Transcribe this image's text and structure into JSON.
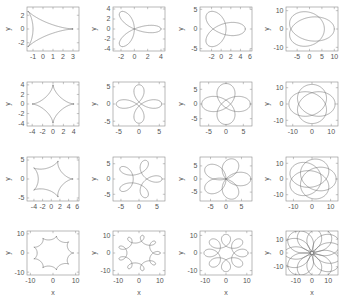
{
  "figure": {
    "type": "small-multiples",
    "rows": 4,
    "cols": 4,
    "background": "#ffffff",
    "curve_color": "#6b6b6b",
    "axis_color": "#8a8a8a",
    "text_color": "#555555"
  },
  "axis_titles": {
    "x": "x",
    "y": "y"
  },
  "chart_data": [
    {
      "id": "plot-r1c1",
      "type": "line",
      "title": "",
      "xlabel": "",
      "ylabel": "y",
      "curve": "hypotrochoid",
      "params": {
        "R": 3,
        "r": 1,
        "d": 1,
        "cusps": 3
      },
      "xlim": [
        -1.6,
        3.6
      ],
      "ylim": [
        -3.2,
        3.2
      ],
      "xticks": [
        -1,
        0,
        1,
        2,
        3
      ],
      "yticks": [
        -2,
        0,
        2
      ],
      "xticklabels": [
        "-1",
        "0",
        "1",
        "2",
        "3"
      ],
      "yticklabels": [
        "-2",
        "0",
        "2"
      ],
      "grid": false,
      "legend": "none"
    },
    {
      "id": "plot-r1c2",
      "type": "line",
      "xlabel": "",
      "ylabel": "y",
      "curve": "hypotrochoid",
      "params": {
        "R": 3,
        "r": 1,
        "d": 2,
        "cusps": 3
      },
      "xlim": [
        -3.2,
        4.6
      ],
      "ylim": [
        -4.4,
        4.4
      ],
      "xticks": [
        -2,
        0,
        2,
        4
      ],
      "yticks": [
        -4,
        -2,
        0,
        2,
        4
      ],
      "xticklabels": [
        "-2",
        "0",
        "2",
        "4"
      ],
      "yticklabels": [
        "-4",
        "-2",
        "0",
        "2",
        "4"
      ],
      "grid": false,
      "legend": "none"
    },
    {
      "id": "plot-r1c3",
      "type": "line",
      "xlabel": "",
      "ylabel": "y",
      "curve": "hypotrochoid",
      "params": {
        "R": 3,
        "r": 1,
        "d": 3,
        "cusps": 3
      },
      "xlim": [
        -4.4,
        6.4
      ],
      "ylim": [
        -5.6,
        5.6
      ],
      "xticks": [
        -2,
        0,
        2,
        4,
        6
      ],
      "yticks": [
        -5,
        0,
        5
      ],
      "xticklabels": [
        "-2",
        "0",
        "2",
        "4",
        "6"
      ],
      "yticklabels": [
        "-5",
        "0",
        "5"
      ],
      "grid": false,
      "legend": "none"
    },
    {
      "id": "plot-r1c4",
      "type": "line",
      "xlabel": "",
      "ylabel": "y",
      "curve": "hypotrochoid",
      "params": {
        "R": 3,
        "r": 1,
        "d": 8,
        "cusps": 3
      },
      "xlim": [
        -9.5,
        11.5
      ],
      "ylim": [
        -12,
        12
      ],
      "xticks": [
        -5,
        0,
        5,
        10
      ],
      "yticks": [
        -10,
        0,
        10
      ],
      "xticklabels": [
        "-5",
        "0",
        "5",
        "10"
      ],
      "yticklabels": [
        "-10",
        "0",
        "10"
      ],
      "grid": false,
      "legend": "none"
    },
    {
      "id": "plot-r2c1",
      "type": "line",
      "xlabel": "",
      "ylabel": "y",
      "curve": "hypotrochoid",
      "params": {
        "R": 4,
        "r": 1,
        "d": 1,
        "cusps": 4
      },
      "xlim": [
        -5.0,
        5.0
      ],
      "ylim": [
        -4.6,
        4.6
      ],
      "xticks": [
        -4,
        -2,
        0,
        2,
        4
      ],
      "yticks": [
        -4,
        -2,
        0,
        2,
        4
      ],
      "xticklabels": [
        "-4",
        "-2",
        "0",
        "2",
        "4"
      ],
      "yticklabels": [
        "-4",
        "-2",
        "0",
        "2",
        "4"
      ],
      "grid": false,
      "legend": "none"
    },
    {
      "id": "plot-r2c2",
      "type": "line",
      "xlabel": "",
      "ylabel": "y",
      "curve": "hypotrochoid",
      "params": {
        "R": 4,
        "r": 1,
        "d": 2.6,
        "cusps": 4
      },
      "xlim": [
        -6.4,
        6.4
      ],
      "ylim": [
        -6.4,
        6.4
      ],
      "xticks": [
        -5,
        0,
        5
      ],
      "yticks": [
        -5,
        0,
        5
      ],
      "xticklabels": [
        "-5",
        "0",
        "5"
      ],
      "yticklabels": [
        "-5",
        "0",
        "5"
      ],
      "grid": false,
      "legend": "none"
    },
    {
      "id": "plot-r2c3",
      "type": "line",
      "xlabel": "",
      "ylabel": "y",
      "curve": "hypotrochoid",
      "params": {
        "R": 4,
        "r": 1,
        "d": 4,
        "cusps": 4
      },
      "xlim": [
        -7.5,
        7.5
      ],
      "ylim": [
        -7.5,
        7.5
      ],
      "xticks": [
        -5,
        0,
        5
      ],
      "yticks": [
        -5,
        0,
        5
      ],
      "xticklabels": [
        "-5",
        "0",
        "5"
      ],
      "yticklabels": [
        "-5",
        "0",
        "5"
      ],
      "grid": false,
      "legend": "none"
    },
    {
      "id": "plot-r2c4",
      "type": "line",
      "xlabel": "",
      "ylabel": "y",
      "curve": "hypotrochoid",
      "params": {
        "R": 4,
        "r": 1,
        "d": 9,
        "cusps": 4
      },
      "xlim": [
        -13.5,
        13.5
      ],
      "ylim": [
        -13.5,
        13.5
      ],
      "xticks": [
        -10,
        0,
        10
      ],
      "yticks": [
        -10,
        0,
        10
      ],
      "xticklabels": [
        "-10",
        "0",
        "10"
      ],
      "yticklabels": [
        "-10",
        "0",
        "10"
      ],
      "grid": false,
      "legend": "none"
    },
    {
      "id": "plot-r3c1",
      "type": "line",
      "xlabel": "",
      "ylabel": "y",
      "curve": "hypotrochoid",
      "params": {
        "R": 5,
        "r": 1,
        "d": 1,
        "cusps": 5
      },
      "xlim": [
        -5.6,
        6.4
      ],
      "ylim": [
        -5.8,
        5.8
      ],
      "xticks": [
        -4,
        -2,
        0,
        2,
        4,
        6
      ],
      "yticks": [
        -5,
        0,
        5
      ],
      "xticklabels": [
        "-4",
        "-2",
        "0",
        "2",
        "4",
        "6"
      ],
      "yticklabels": [
        "-5",
        "0",
        "5"
      ],
      "grid": false,
      "legend": "none"
    },
    {
      "id": "plot-r3c2",
      "type": "line",
      "xlabel": "",
      "ylabel": "y",
      "curve": "hypotrochoid",
      "params": {
        "R": 5,
        "r": 1,
        "d": 2.4,
        "cusps": 5
      },
      "xlim": [
        -7.2,
        7.2
      ],
      "ylim": [
        -7.2,
        7.2
      ],
      "xticks": [
        -5,
        0,
        5
      ],
      "yticks": [
        -5,
        0,
        5
      ],
      "xticklabels": [
        "-5",
        "0",
        "5"
      ],
      "yticklabels": [
        "-5",
        "0",
        "5"
      ],
      "grid": false,
      "legend": "none"
    },
    {
      "id": "plot-r3c3",
      "type": "line",
      "xlabel": "",
      "ylabel": "y",
      "curve": "hypotrochoid",
      "params": {
        "R": 5,
        "r": 1,
        "d": 4,
        "cusps": 5
      },
      "xlim": [
        -8.4,
        8.4
      ],
      "ylim": [
        -8.4,
        8.4
      ],
      "xticks": [
        -5,
        0,
        5
      ],
      "yticks": [
        -5,
        0,
        5
      ],
      "xticklabels": [
        "-5",
        "0",
        "5"
      ],
      "yticklabels": [
        "-5",
        "0",
        "5"
      ],
      "grid": false,
      "legend": "none"
    },
    {
      "id": "plot-r3c4",
      "type": "line",
      "xlabel": "",
      "ylabel": "y",
      "curve": "hypotrochoid",
      "params": {
        "R": 5,
        "r": 1,
        "d": 9,
        "cusps": 5
      },
      "xlim": [
        -14,
        14
      ],
      "ylim": [
        -14,
        14
      ],
      "xticks": [
        -10,
        0,
        10
      ],
      "yticks": [
        -10,
        0,
        10
      ],
      "xticklabels": [
        "-10",
        "0",
        "10"
      ],
      "yticklabels": [
        "-10",
        "0",
        "10"
      ],
      "grid": false,
      "legend": "none"
    },
    {
      "id": "plot-r4c1",
      "type": "line",
      "xlabel": "x",
      "ylabel": "y",
      "curve": "hypotrochoid",
      "params": {
        "R": 9,
        "r": 1,
        "d": 1,
        "cusps": 9
      },
      "xlim": [
        -11.5,
        11.5
      ],
      "ylim": [
        -11.5,
        11.5
      ],
      "xticks": [
        -10,
        0,
        10
      ],
      "yticks": [
        -10,
        0,
        10
      ],
      "xticklabels": [
        "-10",
        "0",
        "10"
      ],
      "yticklabels": [
        "-10",
        "0",
        "10"
      ],
      "grid": false,
      "legend": "none"
    },
    {
      "id": "plot-r4c2",
      "type": "line",
      "xlabel": "x",
      "ylabel": "y",
      "curve": "hypotrochoid",
      "params": {
        "R": 9,
        "r": 1,
        "d": 2.2,
        "cusps": 9
      },
      "xlim": [
        -12.5,
        12.5
      ],
      "ylim": [
        -12.5,
        12.5
      ],
      "xticks": [
        -10,
        0,
        10
      ],
      "yticks": [
        -10,
        0,
        10
      ],
      "xticklabels": [
        "-10",
        "0",
        "10"
      ],
      "yticklabels": [
        "-10",
        "0",
        "10"
      ],
      "grid": false,
      "legend": "none"
    },
    {
      "id": "plot-r4c3",
      "type": "line",
      "xlabel": "x",
      "ylabel": "y",
      "curve": "hypotrochoid",
      "params": {
        "R": 8,
        "r": 1,
        "d": 3.6,
        "cusps": 8
      },
      "xlim": [
        -12.5,
        12.5
      ],
      "ylim": [
        -12.5,
        12.5
      ],
      "xticks": [
        -10,
        0,
        10
      ],
      "yticks": [
        -10,
        0,
        10
      ],
      "xticklabels": [
        "-10",
        "0",
        "10"
      ],
      "yticklabels": [
        "-10",
        "0",
        "10"
      ],
      "grid": false,
      "legend": "none"
    },
    {
      "id": "plot-r4c4",
      "type": "line",
      "xlabel": "x",
      "ylabel": "y",
      "curve": "hypotrochoid",
      "params": {
        "R": 11,
        "r": 1,
        "d": 9,
        "cusps": 11
      },
      "xlim": [
        -16,
        16
      ],
      "ylim": [
        -16,
        16
      ],
      "xticks": [
        -10,
        0,
        10
      ],
      "yticks": [
        -10,
        0,
        10
      ],
      "xticklabels": [
        "-10",
        "0",
        "10"
      ],
      "yticklabels": [
        "-10",
        "0",
        "10"
      ],
      "grid": false,
      "legend": "none"
    }
  ]
}
